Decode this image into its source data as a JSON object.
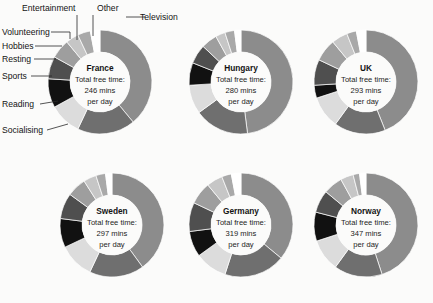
{
  "figure": {
    "background_color": "#fbfbfa",
    "width": 433,
    "height": 303
  },
  "legend": {
    "labels": [
      {
        "name": "entertainment-label",
        "text": "Entertainment"
      },
      {
        "name": "other-label",
        "text": "Other"
      },
      {
        "name": "television-label",
        "text": "Television"
      },
      {
        "name": "volunteering-label",
        "text": "Volunteering"
      },
      {
        "name": "hobbies-label",
        "text": "Hobbies"
      },
      {
        "name": "resting-label",
        "text": "Resting"
      },
      {
        "name": "sports-label",
        "text": "Sports"
      },
      {
        "name": "reading-label",
        "text": "Reading"
      },
      {
        "name": "socialising-label",
        "text": "Socialising"
      }
    ]
  },
  "center_text": {
    "line1": "Total free time:",
    "line3": "per day"
  },
  "chart_data": {
    "type": "pie",
    "title": "",
    "subtitle": "",
    "variant": "donut",
    "legend_position": "left-callouts",
    "grid": false,
    "categories": [
      "Television",
      "Socialising",
      "Reading",
      "Sports",
      "Resting",
      "Hobbies",
      "Volunteering",
      "Entertainment",
      "Other"
    ],
    "colors": [
      "#8c8c8c",
      "#6f6f6f",
      "#dcdcdc",
      "#111111",
      "#4f4f4f",
      "#9e9e9e",
      "#c6c6c6",
      "#a9a9a9",
      "#ffffff"
    ],
    "value_unit": "mins per day",
    "charts": [
      {
        "country": "France",
        "total_label": "246 mins",
        "total_value": 246,
        "values": [
          39,
          18,
          10,
          9,
          7,
          6,
          4,
          4,
          3
        ]
      },
      {
        "country": "Hungary",
        "total_label": "280 mins",
        "total_value": 280,
        "values": [
          48,
          17,
          9,
          7,
          6,
          5,
          3,
          3,
          2
        ]
      },
      {
        "country": "UK",
        "total_label": "293 mins",
        "total_value": 293,
        "values": [
          44,
          16,
          10,
          4,
          8,
          7,
          5,
          3,
          3
        ]
      },
      {
        "country": "Sweden",
        "total_label": "297 mins",
        "total_value": 297,
        "values": [
          40,
          17,
          11,
          9,
          8,
          6,
          4,
          3,
          2
        ]
      },
      {
        "country": "Germany",
        "total_label": "319 mins",
        "total_value": 319,
        "values": [
          36,
          19,
          10,
          8,
          9,
          7,
          5,
          3,
          3
        ]
      },
      {
        "country": "Norway",
        "total_label": "347 mins",
        "total_value": 347,
        "values": [
          45,
          15,
          10,
          9,
          7,
          6,
          4,
          2,
          2
        ]
      }
    ]
  },
  "layout": {
    "centers": [
      {
        "cx": 100,
        "cy": 82
      },
      {
        "cx": 241,
        "cy": 82
      },
      {
        "cx": 366,
        "cy": 82
      },
      {
        "cx": 112,
        "cy": 225
      },
      {
        "cx": 241,
        "cy": 225
      },
      {
        "cx": 366,
        "cy": 225
      }
    ],
    "outer_radius": 52,
    "inner_radius": 30,
    "top_row_outer_radius": 52
  }
}
